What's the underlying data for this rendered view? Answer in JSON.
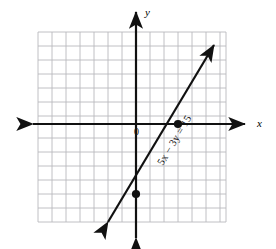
{
  "figure": {
    "kind": "cartesian-line-graph",
    "background_color": "#ffffff",
    "ink_color": "#111111",
    "grid_color": "#b9b9bd"
  },
  "labels": {
    "y_axis": "y",
    "x_axis": "x",
    "origin": "0",
    "equation": "5x − 3y = 15"
  },
  "chart_data": {
    "type": "line",
    "title": "",
    "subtitle": "",
    "xlabel": "x",
    "ylabel": "y",
    "equation": "5x - 3y = 15",
    "slope": 1.6666666667,
    "y_intercept": -5,
    "x_intercept": 3,
    "xlim": [
      -7,
      9
    ],
    "ylim": [
      -7,
      7
    ],
    "grid": true,
    "grid_step": 1,
    "legend": "none",
    "annotations": [
      {
        "text": "5x − 3y = 15",
        "x": 1.4,
        "y": -2.7,
        "rotation_deg": -59
      }
    ],
    "points": [
      {
        "label": "x-intercept",
        "x": 3,
        "y": 0,
        "marker": "filled-circle"
      },
      {
        "label": "y-intercept",
        "x": 0,
        "y": -5,
        "marker": "filled-circle"
      }
    ],
    "line_endpoints": [
      {
        "x": -1.2,
        "y": -7
      },
      {
        "x": 7.1,
        "y": 6.8
      }
    ],
    "axis_arrows": {
      "x_left": true,
      "x_right": true,
      "y_up": true,
      "y_down": true
    },
    "tick_labels": {
      "x": [],
      "y": []
    }
  }
}
